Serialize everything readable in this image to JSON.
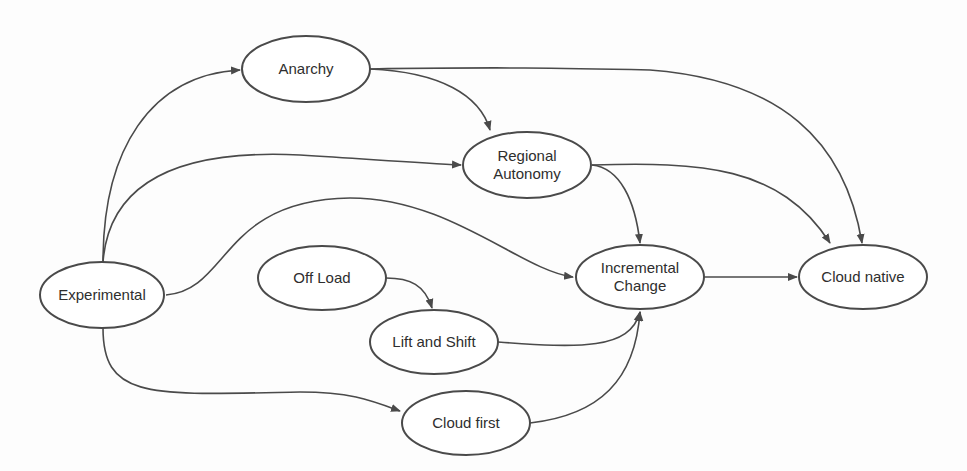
{
  "diagram": {
    "type": "flow",
    "stroke_color": "#4a4a4a",
    "nodes": [
      {
        "id": "anarchy",
        "label": "Anarchy",
        "cx": 306,
        "cy": 69,
        "rx": 64,
        "ry": 33
      },
      {
        "id": "regional-autonomy",
        "label": "Regional\nAutonomy",
        "cx": 527,
        "cy": 165,
        "rx": 64,
        "ry": 33
      },
      {
        "id": "experimental",
        "label": "Experimental",
        "cx": 102,
        "cy": 295,
        "rx": 62,
        "ry": 33
      },
      {
        "id": "off-load",
        "label": "Off Load",
        "cx": 322,
        "cy": 278,
        "rx": 64,
        "ry": 32
      },
      {
        "id": "lift-and-shift",
        "label": "Lift and Shift",
        "cx": 434,
        "cy": 342,
        "rx": 64,
        "ry": 32
      },
      {
        "id": "cloud-first",
        "label": "Cloud first",
        "cx": 466,
        "cy": 423,
        "rx": 64,
        "ry": 32
      },
      {
        "id": "incremental-change",
        "label": "Incremental\nChange",
        "cx": 640,
        "cy": 277,
        "rx": 64,
        "ry": 32
      },
      {
        "id": "cloud-native",
        "label": "Cloud native",
        "cx": 863,
        "cy": 277,
        "rx": 64,
        "ry": 32
      }
    ],
    "edges": [
      {
        "from": "experimental",
        "to": "anarchy",
        "path": "M103,262 C103,150 150,75 240,70"
      },
      {
        "from": "experimental",
        "to": "regional-autonomy",
        "path": "M103,262 C110,170 200,150 300,155 C380,160 420,163 461,165"
      },
      {
        "from": "experimental",
        "to": "incremental-change",
        "path": "M166,295 C230,290 220,200 350,198 C450,198 520,270 573,277"
      },
      {
        "from": "experimental",
        "to": "cloud-first",
        "path": "M103,328 C103,400 150,395 300,392 C350,392 370,400 400,411"
      },
      {
        "from": "anarchy",
        "to": "regional-autonomy",
        "path": "M370,69 C440,72 480,95 490,130"
      },
      {
        "from": "anarchy",
        "to": "cloud-native",
        "path": "M370,69 C500,67 560,68 650,70 C780,80 845,140 862,243"
      },
      {
        "from": "regional-autonomy",
        "to": "incremental-change",
        "path": "M592,165 C620,168 635,200 640,243"
      },
      {
        "from": "regional-autonomy",
        "to": "cloud-native",
        "path": "M592,165 C700,162 780,165 830,243"
      },
      {
        "from": "off-load",
        "to": "lift-and-shift",
        "path": "M386,278 C410,278 425,285 432,308"
      },
      {
        "from": "lift-and-shift",
        "to": "incremental-change",
        "path": "M498,342 C580,348 630,350 640,312"
      },
      {
        "from": "cloud-first",
        "to": "incremental-change",
        "path": "M530,423 C600,415 635,380 640,312"
      },
      {
        "from": "incremental-change",
        "to": "cloud-native",
        "path": "M704,277 L797,277"
      }
    ]
  }
}
